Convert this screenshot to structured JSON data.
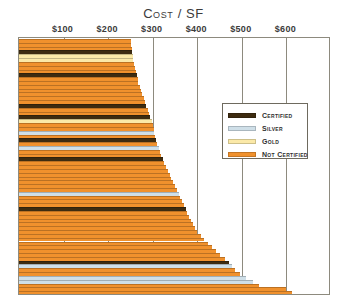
{
  "chart_data": {
    "type": "bar",
    "orientation": "horizontal",
    "title": "Cost / SF",
    "xlabel": "",
    "ylabel": "",
    "xlim": [
      0,
      700
    ],
    "xticks": [
      100,
      200,
      300,
      400,
      500,
      600
    ],
    "xticklabels": [
      "$100",
      "$200",
      "$300",
      "$400",
      "$500",
      "$600"
    ],
    "grid": "vertical",
    "legend_position": "inner-right",
    "sorted": "ascending-top-to-bottom",
    "categories_hidden": true,
    "colors": {
      "certified": "#3d2b10",
      "silver": "#cfdfe8",
      "gold": "#fbe9a8",
      "not_certified": "#f0912d"
    },
    "legend": [
      {
        "label": "Certified",
        "key": "certified",
        "color": "#3d2b10"
      },
      {
        "label": "Silver",
        "key": "silver",
        "color": "#cfdfe8"
      },
      {
        "label": "Gold",
        "key": "gold",
        "color": "#fbe9a8"
      },
      {
        "label": "Not Certified",
        "key": "not_certified",
        "color": "#f0912d"
      }
    ],
    "bars": [
      {
        "value": 251,
        "cert": "not_certified"
      },
      {
        "value": 252,
        "cert": "not_certified"
      },
      {
        "value": 253,
        "cert": "not_certified"
      },
      {
        "value": 254,
        "cert": "certified"
      },
      {
        "value": 255,
        "cert": "gold"
      },
      {
        "value": 256,
        "cert": "gold"
      },
      {
        "value": 258,
        "cert": "not_certified"
      },
      {
        "value": 260,
        "cert": "not_certified"
      },
      {
        "value": 262,
        "cert": "not_certified"
      },
      {
        "value": 264,
        "cert": "certified"
      },
      {
        "value": 266,
        "cert": "not_certified"
      },
      {
        "value": 268,
        "cert": "not_certified"
      },
      {
        "value": 271,
        "cert": "not_certified"
      },
      {
        "value": 274,
        "cert": "not_certified"
      },
      {
        "value": 277,
        "cert": "not_certified"
      },
      {
        "value": 280,
        "cert": "not_certified"
      },
      {
        "value": 283,
        "cert": "not_certified"
      },
      {
        "value": 286,
        "cert": "certified"
      },
      {
        "value": 289,
        "cert": "not_certified"
      },
      {
        "value": 292,
        "cert": "not_certified"
      },
      {
        "value": 295,
        "cert": "certified"
      },
      {
        "value": 298,
        "cert": "gold"
      },
      {
        "value": 300,
        "cert": "not_certified"
      },
      {
        "value": 302,
        "cert": "not_certified"
      },
      {
        "value": 304,
        "cert": "silver"
      },
      {
        "value": 306,
        "cert": "not_certified"
      },
      {
        "value": 308,
        "cert": "certified"
      },
      {
        "value": 310,
        "cert": "not_certified"
      },
      {
        "value": 313,
        "cert": "silver"
      },
      {
        "value": 316,
        "cert": "not_certified"
      },
      {
        "value": 319,
        "cert": "not_certified"
      },
      {
        "value": 322,
        "cert": "certified"
      },
      {
        "value": 326,
        "cert": "not_certified"
      },
      {
        "value": 330,
        "cert": "not_certified"
      },
      {
        "value": 334,
        "cert": "not_certified"
      },
      {
        "value": 338,
        "cert": "not_certified"
      },
      {
        "value": 342,
        "cert": "not_certified"
      },
      {
        "value": 346,
        "cert": "not_certified"
      },
      {
        "value": 350,
        "cert": "not_certified"
      },
      {
        "value": 354,
        "cert": "not_certified"
      },
      {
        "value": 358,
        "cert": "silver"
      },
      {
        "value": 362,
        "cert": "not_certified"
      },
      {
        "value": 366,
        "cert": "not_certified"
      },
      {
        "value": 370,
        "cert": "not_certified"
      },
      {
        "value": 374,
        "cert": "certified"
      },
      {
        "value": 378,
        "cert": "not_certified"
      },
      {
        "value": 382,
        "cert": "not_certified"
      },
      {
        "value": 386,
        "cert": "not_certified"
      },
      {
        "value": 390,
        "cert": "not_certified"
      },
      {
        "value": 395,
        "cert": "not_certified"
      },
      {
        "value": 400,
        "cert": "not_certified"
      },
      {
        "value": 408,
        "cert": "not_certified"
      },
      {
        "value": 416,
        "cert": "not_certified"
      },
      {
        "value": 424,
        "cert": "not_certified"
      },
      {
        "value": 432,
        "cert": "not_certified"
      },
      {
        "value": 441,
        "cert": "not_certified"
      },
      {
        "value": 450,
        "cert": "not_certified"
      },
      {
        "value": 462,
        "cert": "not_certified"
      },
      {
        "value": 472,
        "cert": "certified"
      },
      {
        "value": 478,
        "cert": "silver"
      },
      {
        "value": 484,
        "cert": "not_certified"
      },
      {
        "value": 495,
        "cert": "not_certified"
      },
      {
        "value": 510,
        "cert": "silver"
      },
      {
        "value": 524,
        "cert": "silver"
      },
      {
        "value": 538,
        "cert": "not_certified"
      },
      {
        "value": 600,
        "cert": "not_certified"
      },
      {
        "value": 612,
        "cert": "not_certified"
      }
    ]
  }
}
